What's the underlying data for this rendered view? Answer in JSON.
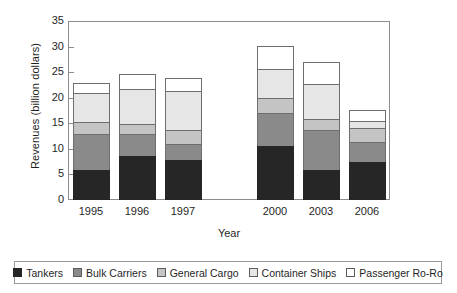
{
  "chart_data": {
    "type": "bar",
    "stacked": true,
    "title": "",
    "xlabel": "Year",
    "ylabel": "Revenues (billion dollars)",
    "categories": [
      "1995",
      "1996",
      "1997",
      "",
      "2000",
      "2003",
      "2006"
    ],
    "ylim": [
      0,
      35
    ],
    "yticks": [
      0,
      5,
      10,
      15,
      20,
      25,
      30,
      35
    ],
    "grid": false,
    "legend_position": "bottom",
    "series": [
      {
        "name": "Tankers",
        "color": "#262626",
        "values": [
          5.8,
          8.6,
          7.9,
          null,
          10.6,
          5.9,
          7.4
        ]
      },
      {
        "name": "Bulk Carriers",
        "color": "#8a8a8a",
        "values": [
          7.1,
          4.3,
          3.0,
          null,
          6.4,
          7.7,
          3.9
        ]
      },
      {
        "name": "General Cargo",
        "color": "#c4c4c4",
        "values": [
          2.4,
          2.0,
          2.8,
          null,
          2.9,
          2.3,
          2.8
        ]
      },
      {
        "name": "Container Ships",
        "color": "#e6e6e6",
        "values": [
          5.7,
          6.9,
          7.6,
          null,
          5.7,
          6.8,
          1.4
        ]
      },
      {
        "name": "Passenger Ro-Ro",
        "color": "#ffffff",
        "values": [
          1.8,
          2.8,
          2.6,
          null,
          4.6,
          4.3,
          2.1
        ]
      }
    ],
    "totals": [
      22.8,
      24.6,
      23.9,
      null,
      30.2,
      27.0,
      17.6
    ],
    "cumulative_tops": [
      [
        5.8,
        12.9,
        15.3,
        21.0,
        22.8
      ],
      [
        8.6,
        12.9,
        14.9,
        21.8,
        24.6
      ],
      [
        7.9,
        10.9,
        13.7,
        21.3,
        23.9
      ],
      [
        null,
        null,
        null,
        null,
        null
      ],
      [
        10.6,
        17.0,
        19.9,
        25.6,
        30.2
      ],
      [
        5.9,
        13.6,
        15.9,
        22.7,
        27.0
      ],
      [
        7.4,
        11.3,
        14.1,
        15.5,
        17.6
      ]
    ]
  },
  "axis": {
    "y_title": "Revenues (billion dollars)",
    "x_title": "Year",
    "y_tick_labels": [
      "35",
      "30",
      "25",
      "20",
      "15",
      "10",
      "5",
      "0"
    ],
    "x_tick_labels": [
      "1995",
      "1996",
      "1997",
      "2000",
      "2003",
      "2006"
    ]
  },
  "legend": {
    "items": [
      {
        "label": "Tankers",
        "color": "#262626"
      },
      {
        "label": "Bulk Carriers",
        "color": "#8a8a8a"
      },
      {
        "label": "General Cargo",
        "color": "#c4c4c4"
      },
      {
        "label": "Container Ships",
        "color": "#e6e6e6"
      },
      {
        "label": "Passenger Ro-Ro",
        "color": "#ffffff"
      }
    ]
  }
}
